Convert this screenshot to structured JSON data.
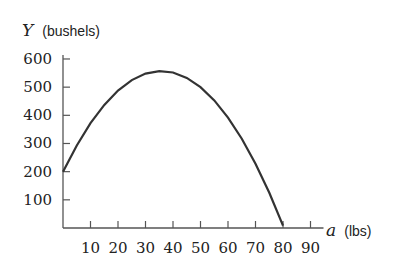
{
  "chart_data": {
    "type": "line",
    "title": "",
    "ylabel": {
      "var": "Y",
      "unit": "(bushels)"
    },
    "xlabel": {
      "var": "a",
      "unit": "(lbs)"
    },
    "xlim": [
      0,
      90
    ],
    "ylim": [
      0,
      600
    ],
    "xticks": [
      10,
      20,
      30,
      40,
      50,
      60,
      70,
      80,
      90
    ],
    "yticks": [
      100,
      200,
      300,
      400,
      500,
      600
    ],
    "grid": false,
    "legend": null,
    "series": [
      {
        "name": "Y(a)",
        "x": [
          0,
          5,
          10,
          15,
          20,
          25,
          30,
          35,
          40,
          45,
          50,
          55,
          60,
          65,
          70,
          75,
          80
        ],
        "values": [
          200,
          293,
          372,
          437,
          488,
          525,
          548,
          557,
          552,
          533,
          500,
          453,
          392,
          317,
          228,
          125,
          8
        ]
      }
    ],
    "color": "#333333"
  }
}
